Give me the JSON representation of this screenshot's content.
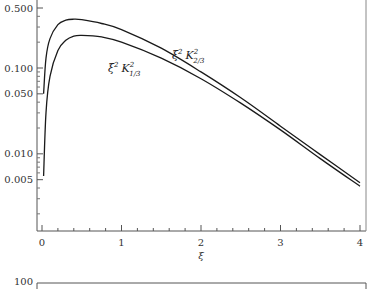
{
  "chart_data": {
    "type": "line",
    "title": "",
    "xlabel": "ξ",
    "ylabel": "",
    "xlim": [
      0,
      4
    ],
    "ylim": [
      0.0015,
      0.6
    ],
    "yscale": "log",
    "grid": false,
    "legend": "inline curve labels",
    "x_ticks": [
      "0",
      "1",
      "2",
      "3",
      "4"
    ],
    "y_ticks": [
      "0.500",
      "0.100",
      "0.050",
      "0.010",
      "0.005"
    ],
    "series": [
      {
        "name": "ξ² K²₂/₃",
        "label_main": "ξ",
        "label_sup1": "2",
        "label_K": "K",
        "label_sup2": "2",
        "label_sub": "2/3",
        "x": [
          0.02,
          0.05,
          0.1,
          0.2,
          0.3,
          0.4,
          0.5,
          0.75,
          1.0,
          1.5,
          2.0,
          2.5,
          3.0,
          3.5,
          4.0
        ],
        "values": [
          0.05,
          0.13,
          0.22,
          0.32,
          0.36,
          0.37,
          0.365,
          0.33,
          0.28,
          0.17,
          0.09,
          0.045,
          0.021,
          0.0098,
          0.0046
        ]
      },
      {
        "name": "ξ² K²₁/₃",
        "label_main": "ξ",
        "label_sup1": "2",
        "label_K": "K",
        "label_sup2": "2",
        "label_sub": "1/3",
        "x": [
          0.02,
          0.05,
          0.1,
          0.2,
          0.3,
          0.4,
          0.5,
          0.75,
          1.0,
          1.5,
          2.0,
          2.5,
          3.0,
          3.5,
          4.0
        ],
        "values": [
          0.0055,
          0.03,
          0.08,
          0.16,
          0.21,
          0.235,
          0.24,
          0.23,
          0.2,
          0.13,
          0.075,
          0.039,
          0.019,
          0.0088,
          0.0042
        ]
      }
    ]
  },
  "next_plot": {
    "y_top_tick": "100"
  }
}
